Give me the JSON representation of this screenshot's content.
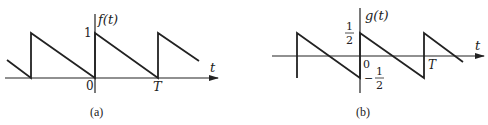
{
  "panels": [
    {
      "id": "a",
      "caption": "(a)",
      "function_label": "f(t)",
      "axis_label_t": "t",
      "tick_labels": {
        "origin": "0",
        "period": "T",
        "peak": "1"
      },
      "description": "Sawtooth wave: jumps to 1 at t=0, decreases linearly to 0 at t=T, repeats"
    },
    {
      "id": "b",
      "caption": "(b)",
      "function_label": "g(t)",
      "axis_label_t": "t",
      "tick_labels": {
        "origin": "0",
        "period": "T",
        "top_num": "1",
        "top_den": "2",
        "bottom_sign": "−",
        "bottom_num": "1",
        "bottom_den": "2"
      },
      "description": "Zero-mean sawtooth: jumps from -1/2 to 1/2 at t=0, decreases linearly to -1/2 at t=T, repeats"
    }
  ],
  "colors": {
    "line": "#222222",
    "background": "#ffffff"
  }
}
